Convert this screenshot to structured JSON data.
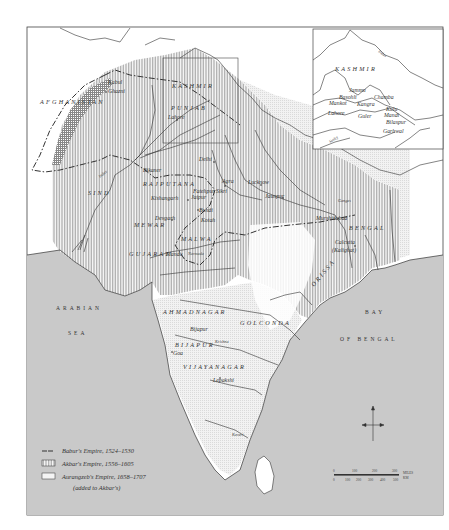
{
  "map": {
    "colors": {
      "sea": "#c9c9c9",
      "land": "#ffffff",
      "akbar_hatch": "#b5b5b5",
      "aurangzeb_tint": "#e6e6e6",
      "babur_line": "#333333",
      "border": "#555555"
    },
    "regions": [
      {
        "id": "afghanistan",
        "label": "AFGHANISTAN"
      },
      {
        "id": "kashmir",
        "label": "KASHMIR"
      },
      {
        "id": "punjab",
        "label": "PUNJAB"
      },
      {
        "id": "sind",
        "label": "SIND"
      },
      {
        "id": "rajputana",
        "label": "RAJPUTANA"
      },
      {
        "id": "mewar",
        "label": "MEWAR"
      },
      {
        "id": "malwa",
        "label": "MALWA"
      },
      {
        "id": "gujarat",
        "label": "GUJARAT"
      },
      {
        "id": "bengal",
        "label": "BENGAL"
      },
      {
        "id": "orissa",
        "label": "ORISSA"
      },
      {
        "id": "ahmadnagar",
        "label": "AHMADNAGAR"
      },
      {
        "id": "golconda",
        "label": "GOLCONDA"
      },
      {
        "id": "bijapur",
        "label": "BIJAPUR"
      },
      {
        "id": "vijayanagar",
        "label": "VIJAYANAGAR"
      }
    ],
    "cities": [
      {
        "id": "kabul",
        "label": "Kabul"
      },
      {
        "id": "ghazni",
        "label": "Ghazni"
      },
      {
        "id": "lahore",
        "label": "Lahore"
      },
      {
        "id": "delhi",
        "label": "Delhi"
      },
      {
        "id": "bikaner",
        "label": "Bikaner"
      },
      {
        "id": "agra",
        "label": "Agra"
      },
      {
        "id": "lucknow",
        "label": "Lucknow"
      },
      {
        "id": "fatehpur",
        "label": "Fatehpur Sikri"
      },
      {
        "id": "jaunpur",
        "label": "Jaunpur"
      },
      {
        "id": "kishangarh",
        "label": "Kishangarh"
      },
      {
        "id": "jaipur",
        "label": "Jaipur"
      },
      {
        "id": "devgarh",
        "label": "Devgarh"
      },
      {
        "id": "bundi",
        "label": "Bundi"
      },
      {
        "id": "kotah",
        "label": "Kotah"
      },
      {
        "id": "mandu",
        "label": "Mandu"
      },
      {
        "id": "murshidabad",
        "label": "Murshidabad"
      },
      {
        "id": "calcutta",
        "label": "Calcutta"
      },
      {
        "id": "kalighat",
        "label": "(Kalighat)"
      },
      {
        "id": "bijapur_city",
        "label": "Bijapur"
      },
      {
        "id": "goa",
        "label": "Goa"
      },
      {
        "id": "lepakshi",
        "label": "Lepakshi"
      }
    ],
    "rivers": [
      {
        "id": "ganges",
        "label": "Ganges"
      },
      {
        "id": "indus",
        "label": "Indus"
      },
      {
        "id": "narmada",
        "label": "Narmada"
      },
      {
        "id": "krishna",
        "label": "Krishna"
      },
      {
        "id": "kaveri",
        "label": "Kaveri"
      }
    ],
    "seas": {
      "arabian_1": "ARABIAN",
      "arabian_2": "SEA",
      "bay_1": "BAY",
      "bay_2": "OF BENGAL"
    },
    "inset": {
      "region": "KASHMIR",
      "river_indus": "Indus",
      "river_sutlej": "Sutlej",
      "places": [
        {
          "id": "jammu",
          "label": "Jammu"
        },
        {
          "id": "basohli",
          "label": "Basohli"
        },
        {
          "id": "chamba",
          "label": "Chamba"
        },
        {
          "id": "mankot",
          "label": "Mankot"
        },
        {
          "id": "kangra",
          "label": "Kangra"
        },
        {
          "id": "kulu",
          "label": "Kulu"
        },
        {
          "id": "lahore_inset",
          "label": "Lahore"
        },
        {
          "id": "guler",
          "label": "Guler"
        },
        {
          "id": "mandi",
          "label": "Mandi"
        },
        {
          "id": "bilaspur",
          "label": "Bilaspur"
        },
        {
          "id": "garhwal",
          "label": "Garhwal"
        }
      ]
    },
    "legend": {
      "items": [
        {
          "symbol": "dashed-line",
          "label": "Babur's Empire, 1524–1530"
        },
        {
          "symbol": "hatched-box",
          "label": "Akbar's Empire, 1556–1605"
        },
        {
          "symbol": "tinted-box",
          "label": "Aurangzeb's Empire, 1658–1707"
        }
      ],
      "note": "(added to Akbar's)"
    },
    "scale": {
      "miles_ticks": [
        "0",
        "100",
        "200",
        "300"
      ],
      "miles_unit": "MILES",
      "km_ticks": [
        "0",
        "100",
        "200",
        "300",
        "400",
        "500"
      ],
      "km_unit": "KM"
    }
  }
}
